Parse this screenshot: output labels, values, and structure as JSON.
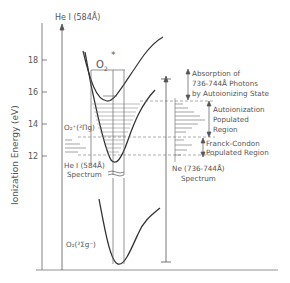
{
  "diagram": {
    "y_axis": {
      "label": "Ionization Energy (eV)",
      "ticks": [
        "18",
        "16",
        "14",
        "12"
      ]
    },
    "labels": {
      "hei_top": "He I (584Å)",
      "o2_star": "O",
      "o2_star_sub": "2",
      "o2_star_sup": "*",
      "o2_ion_state": "O₂⁺(²Πg)",
      "o2_ground_state": "O₂(³Σg⁻)",
      "hei_spectrum_line1": "He I (584Å)",
      "hei_spectrum_line2": "Spectrum",
      "ne_spectrum_line1": "Ne (736-744Å)",
      "ne_spectrum_line2": "Spectrum",
      "absorption_line1": "Absorption  of",
      "absorption_line2": "736-744Å  Photons",
      "absorption_line3": "by Autoionizing State",
      "autoion_line1": "Autoionization",
      "autoion_line2": "Populated",
      "autoion_line3": "Region",
      "franck_line1": "Franck-Condon",
      "franck_line2": "Populated Region"
    },
    "colors": {
      "ink": "#333333",
      "faint": "#777777"
    }
  }
}
